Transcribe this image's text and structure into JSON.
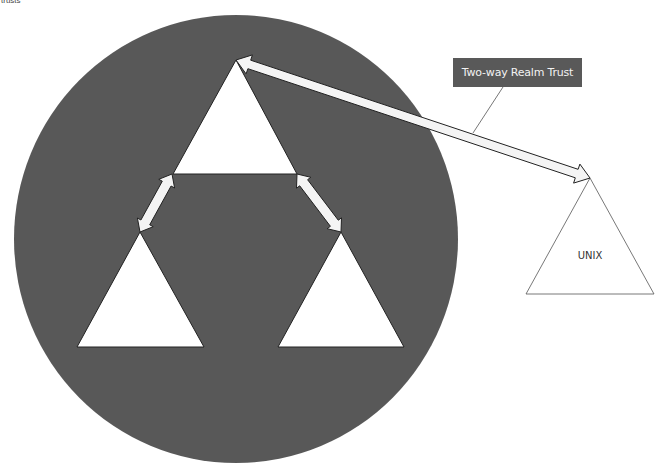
{
  "caption": {
    "text": "trusts"
  },
  "diagram": {
    "forest_circle": {
      "cx": 236,
      "cy": 239,
      "rx": 222,
      "ry": 224,
      "fill": "#595959"
    },
    "domains": [
      {
        "id": "root",
        "points": "236,60 173,174 297,174",
        "label": ""
      },
      {
        "id": "child-left",
        "points": "140,232 77,347 204,347",
        "label": ""
      },
      {
        "id": "child-right",
        "points": "341,232 278,347 404,347",
        "label": ""
      },
      {
        "id": "unix",
        "points": "590,178 526,294 654,294",
        "label": "UNIX"
      }
    ],
    "trusts": [
      {
        "from": [
          172,
          174
        ],
        "to": [
          140,
          232
        ],
        "type": "two-way"
      },
      {
        "from": [
          297,
          174
        ],
        "to": [
          341,
          232
        ],
        "type": "two-way"
      },
      {
        "from": [
          236,
          60
        ],
        "to": [
          590,
          178
        ],
        "type": "two-way-realm"
      }
    ],
    "callout": {
      "text": "Two-way Realm Trust",
      "color": "#595959",
      "pointer_from": [
        503,
        87
      ],
      "pointer_to": [
        473,
        133
      ]
    },
    "unix_label": "UNIX"
  }
}
